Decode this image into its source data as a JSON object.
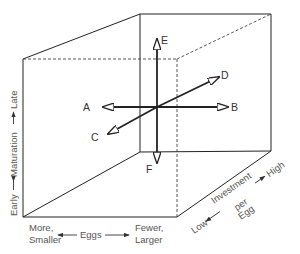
{
  "diagram": {
    "type": "3d-cube-trait-space",
    "colors": {
      "line": "#222222",
      "dashed": "#444444",
      "text": "#333333",
      "axis_text": "#555555",
      "background": "#ffffff"
    },
    "vectors": [
      {
        "id": "A",
        "label": "A",
        "direction": "left"
      },
      {
        "id": "B",
        "label": "B",
        "direction": "right"
      },
      {
        "id": "C",
        "label": "C",
        "direction": "front-down-left"
      },
      {
        "id": "D",
        "label": "D",
        "direction": "back-up-right"
      },
      {
        "id": "E",
        "label": "E",
        "direction": "up"
      },
      {
        "id": "F",
        "label": "F",
        "direction": "down"
      }
    ],
    "axes": {
      "vertical": {
        "name": "Maturation",
        "low": "Early",
        "high": "Late"
      },
      "horizontal": {
        "name": "Eggs",
        "low_line1": "More,",
        "low_line2": "Smaller",
        "high_line1": "Fewer,",
        "high_line2": "Larger"
      },
      "depth": {
        "name_line1": "Investment",
        "name_line2": "per",
        "name_line3": "Egg",
        "low": "Low",
        "high": "High"
      }
    }
  }
}
